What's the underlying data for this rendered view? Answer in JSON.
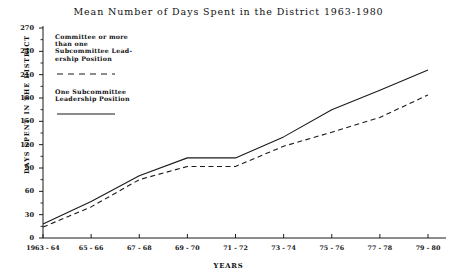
{
  "chart_data": {
    "type": "line",
    "title": "Mean Number of Days Spent in the District 1963-1980",
    "xlabel": "YEARS",
    "ylabel": "DAYS SPENT IN THE DISTRICT",
    "categories": [
      "1963 - 64",
      "65 - 66",
      "67 - 68",
      "69 - 70",
      "71 - 72",
      "73 - 74",
      "75 - 76",
      "77 - 78",
      "79 - 80"
    ],
    "ylim": [
      0,
      270
    ],
    "yticks": [
      0,
      30,
      60,
      90,
      120,
      150,
      180,
      210,
      240,
      270
    ],
    "grid": false,
    "legend_position": "upper-left-inside",
    "series": [
      {
        "name": "Committee or more than one Subcommittee Leadership Position",
        "style": "dashed",
        "color": "#1a1a1a",
        "values": [
          14,
          40,
          75,
          92,
          92,
          118,
          136,
          155,
          184
        ]
      },
      {
        "name": "One Subcommittee Leadership Position",
        "style": "solid",
        "color": "#1a1a1a",
        "values": [
          18,
          47,
          80,
          103,
          103,
          130,
          165,
          190,
          216
        ]
      }
    ]
  },
  "legend": {
    "entries": [
      {
        "lines": [
          "Committee or more",
          "than one",
          "Subcommittee Lead-",
          "ership Position"
        ],
        "style": "dashed"
      },
      {
        "lines": [
          "One Subcommittee",
          "Leadership Position"
        ],
        "style": "solid"
      }
    ]
  }
}
